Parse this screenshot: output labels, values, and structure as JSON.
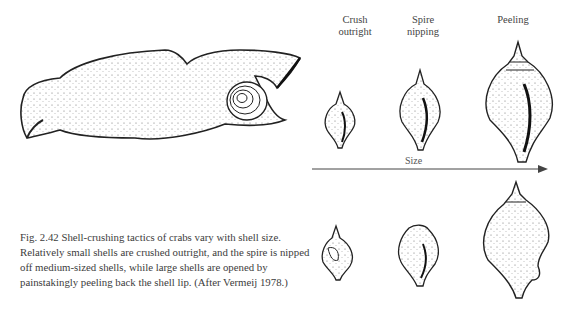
{
  "figure": {
    "column_labels": [
      {
        "line1": "Crush",
        "line2": "outright"
      },
      {
        "line1": "Spire",
        "line2": "nipping"
      },
      {
        "line1": "Peeling",
        "line2": ""
      }
    ],
    "axis_label": "Size",
    "illustrations": {
      "crab_claw": "crab-claw-holding-snail-illustration",
      "top_row": [
        "small-shell-intact",
        "medium-shell-intact",
        "large-shell-intact"
      ],
      "bottom_row": [
        "small-shell-crushed",
        "medium-shell-spire-nipped",
        "large-shell-peeled"
      ]
    }
  },
  "caption": {
    "text": "Fig. 2.42  Shell-crushing tactics of crabs vary with shell size. Relatively small shells are crushed outright, and the spire is nipped off medium-sized shells, while large shells are opened by painstakingly peeling back the shell lip. (After Vermeij 1978.)"
  }
}
